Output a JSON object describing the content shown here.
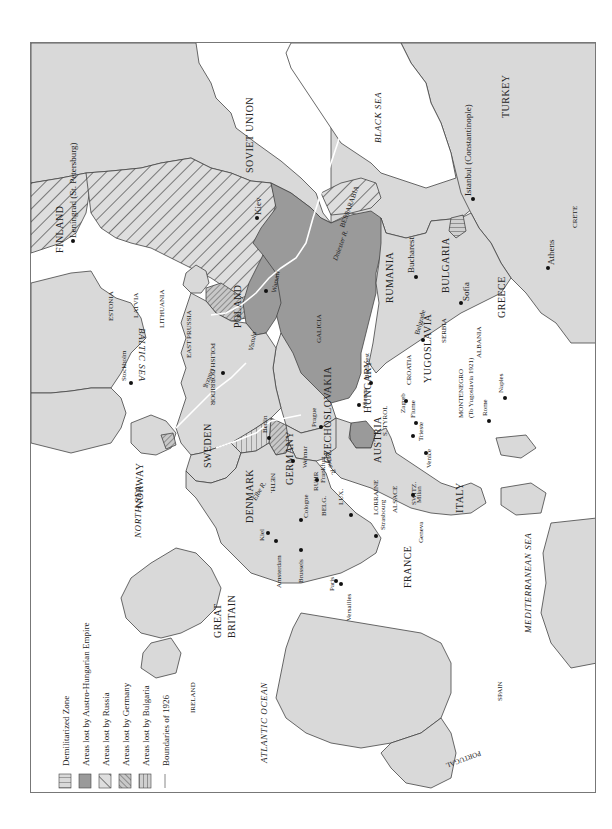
{
  "legend": {
    "items": [
      {
        "label": "Demilitarized Zone",
        "pattern": "dmz"
      },
      {
        "label": "Areas lost by Austro-Hungarian Empire",
        "pattern": "austria"
      },
      {
        "label": "Areas lost by Russia",
        "pattern": "russia"
      },
      {
        "label": "Areas lost by Germany",
        "pattern": "germany"
      },
      {
        "label": "Areas lost by Bulgaria",
        "pattern": "bulgaria"
      },
      {
        "label": "Boundaries of 1926",
        "pattern": "line"
      }
    ]
  },
  "colors": {
    "land": "#d9d9d9",
    "sea": "#ffffff",
    "austro_hungarian": "#9a9a9a",
    "hatch": "#707070",
    "border": "#444444",
    "boundary_1926": "#ffffff"
  },
  "seas": {
    "black_sea": "BLACK SEA",
    "baltic_sea": "BALTIC SEA",
    "north_sea": "NORTH SEA",
    "atlantic": "ATLANTIC OCEAN",
    "mediterranean": "MEDITERRANEAN SEA"
  },
  "countries": {
    "soviet_union": "SOVIET UNION",
    "finland": "FINLAND",
    "estonia": "ESTONIA",
    "latvia": "LATVIA",
    "lithuania": "LITHUANIA",
    "poland": "POLAND",
    "east_prussia": "EAST PRUSSIA",
    "polish_corridor": "POLISH CORRIDOR",
    "galicia": "GALICIA",
    "bessarabia": "BESSARABIA",
    "rumania": "RUMANIA",
    "czechoslovakia": "CZECHOSLOVAKIA",
    "hungary": "HUNGARY",
    "yugoslavia": "YUGOSLAVIA",
    "croatia": "CROATIA",
    "serbia": "SERBIA",
    "bulgaria": "BULGARIA",
    "albania": "ALBANIA",
    "greece": "GREECE",
    "turkey": "TURKEY",
    "crete": "CRETE",
    "montenegro": "MONTENEGRO",
    "montenegro_note": "(To Yugoslavia 1921)",
    "austria": "AUSTRIA",
    "germany": "GERMANY",
    "sweden": "SWEDEN",
    "norway": "NORWAY",
    "denmark": "DENMARK",
    "netherlands": "NETH.",
    "belgium": "BELG.",
    "luxembourg": "LUX.",
    "ruhr": "RUHR",
    "switzerland": "SWITZ.",
    "italy": "ITALY",
    "france": "FRANCE",
    "lorraine": "LORRAINE",
    "alsace": "ALSACE",
    "tyrol": "S. TYROL",
    "great_britain_1": "GREAT",
    "great_britain_2": "BRITAIN",
    "ireland": "IRELAND",
    "spain": "SPAIN",
    "portugal": "PORTUGAL"
  },
  "rivers": {
    "dniester": "Dniester R.",
    "vistula": "Vistula",
    "elbe": "Elbe R.",
    "rhine": "Rhine R.",
    "r": "R."
  },
  "cities": {
    "leningrad": "Leningrad (St. Petersburg)",
    "kiev": "Kiev",
    "istanbul": "Istanbul (Constantinople)",
    "bucharest": "Bucharest",
    "sofia": "Sofia",
    "athens": "Athens",
    "belgrade": "Belgrade",
    "budapest": "Budapest",
    "warsaw": "Warsaw",
    "danzig": "Danzig",
    "stockholm": "Stockholm",
    "berlin": "Berlin",
    "prague": "Prague",
    "vienna": "Vienna",
    "zagreb": "Zagreb",
    "fiume": "Fiume",
    "trieste": "Trieste",
    "venice": "Venice",
    "milan": "Milan",
    "rome": "Rome",
    "naples": "Naples",
    "weimar": "Weimar",
    "frankfurt": "Frankfurt",
    "cologne": "Cologne",
    "kiel": "Kiel",
    "amsterdam": "Amsterdam",
    "brussels": "Brussels",
    "strasbourg": "Strasbourg",
    "geneva": "Geneva",
    "paris": "Paris",
    "versailles": "Versailles"
  }
}
